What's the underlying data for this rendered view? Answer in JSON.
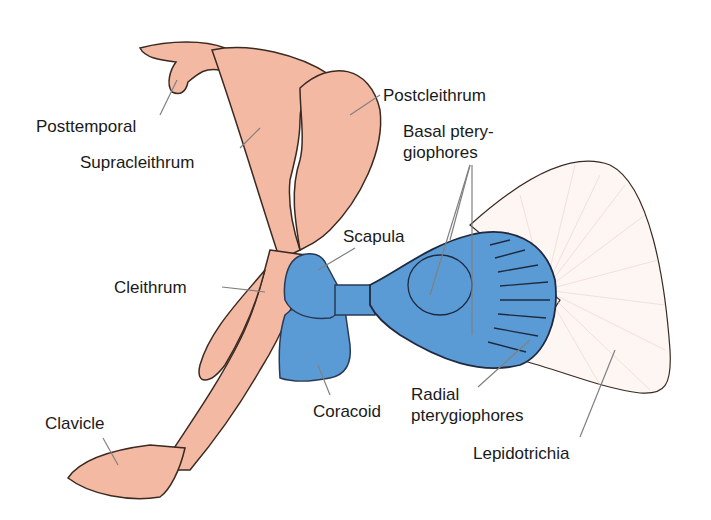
{
  "diagram": {
    "colors": {
      "dermal_bone": "#f4b9a3",
      "endochondral_bone": "#5b9bd5",
      "outline": "#3a2a22",
      "fin_rays": "#fbf3f0",
      "leader_line": "#808080",
      "label_text": "#1a1a1a"
    },
    "labels": {
      "posttemporal": "Posttemporal",
      "supracleithrum": "Supracleithrum",
      "postcleithrum": "Postcleithrum",
      "basal_line1": "Basal ptery-",
      "basal_line2": "giophores",
      "scapula": "Scapula",
      "cleithrum": "Cleithrum",
      "coracoid": "Coracoid",
      "radial_line1": "Radial",
      "radial_line2": "pterygiophores",
      "clavicle": "Clavicle",
      "lepidotrichia": "Lepidotrichia"
    }
  }
}
